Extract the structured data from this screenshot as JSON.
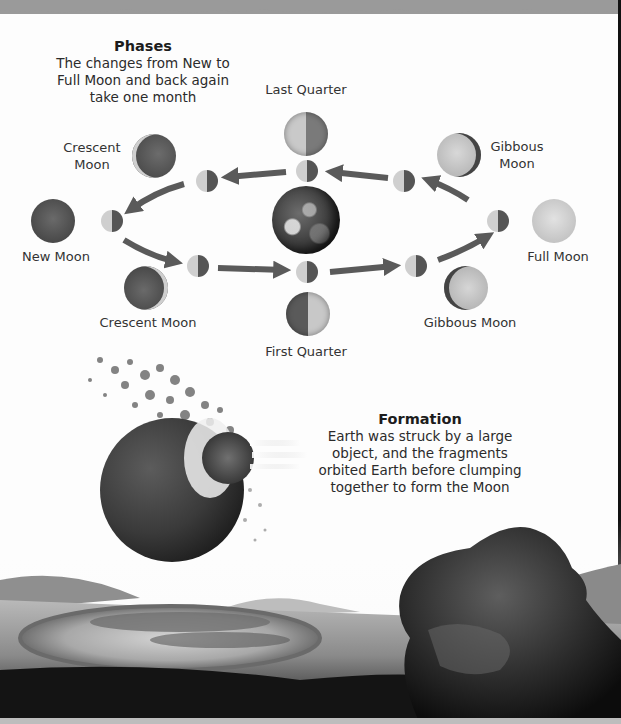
{
  "phases": {
    "heading": "Phases",
    "description_lines": [
      "The changes from New to",
      "Full Moon and back again",
      "take one month"
    ]
  },
  "moon_labels": {
    "last_quarter": "Last Quarter",
    "crescent_top_line1": "Crescent",
    "crescent_top_line2": "Moon",
    "gibbous_top_line1": "Gibbous",
    "gibbous_top_line2": "Moon",
    "new_moon": "New Moon",
    "full_moon": "Full Moon",
    "crescent_bottom": "Crescent Moon",
    "gibbous_bottom": "Gibbous Moon",
    "first_quarter": "First Quarter"
  },
  "formation": {
    "heading": "Formation",
    "description_lines": [
      "Earth was struck by a large",
      "object, and the fragments",
      "orbited Earth before clumping",
      "together to form the Moon"
    ]
  },
  "colors": {
    "page_background": "#fdfdfd",
    "text": "#2b2b2b",
    "arrow": "#5a5a5a",
    "torn_edge": "#9a9a9a"
  }
}
